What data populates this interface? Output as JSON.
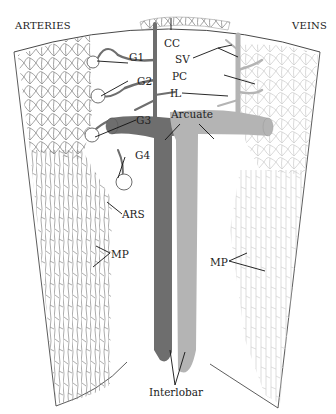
{
  "diagram": {
    "headings": {
      "left": "ARTERIES",
      "right": "VEINS"
    },
    "labels": {
      "cc": "CC",
      "sv": "SV",
      "pc": "PC",
      "il": "IL",
      "g1": "G1",
      "g2": "G2",
      "g3": "G3",
      "g4": "G4",
      "arcuate": "Arcuate",
      "ars": "ARS",
      "mp_left": "MP",
      "mp_right": "MP",
      "interlobar": "Interlobar"
    },
    "colors": {
      "artery": "#6e6e6e",
      "vein": "#b4b4b4",
      "outline": "#333333",
      "artery_mesh": "#8a8a8a",
      "vein_mesh": "#cfcfcf"
    }
  }
}
